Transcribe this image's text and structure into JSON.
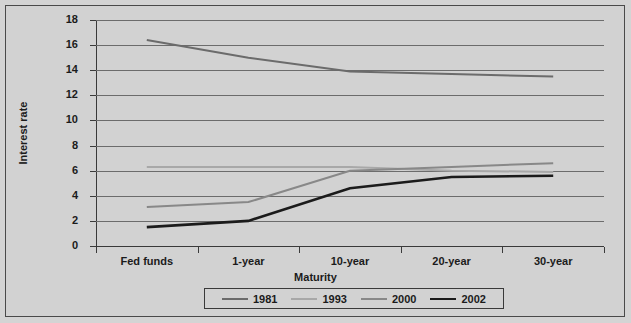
{
  "chart_data": {
    "type": "line",
    "title": "",
    "xlabel": "Maturity",
    "ylabel": "Interest rate",
    "categories": [
      "Fed funds",
      "1-year",
      "10-year",
      "20-year",
      "30-year"
    ],
    "ylim": [
      0,
      18
    ],
    "ytick_step": 2,
    "yticks": [
      "0",
      "2",
      "4",
      "6",
      "8",
      "10",
      "12",
      "14",
      "16",
      "18"
    ],
    "grid": true,
    "legend_position": "bottom",
    "series": [
      {
        "name": "1981",
        "color": "#6b6b6b",
        "width": 2.0,
        "values": [
          16.4,
          15.0,
          13.9,
          13.7,
          13.5
        ]
      },
      {
        "name": "1993",
        "color": "#a8a8a8",
        "width": 2.0,
        "values": [
          6.3,
          6.3,
          6.3,
          6.0,
          5.9
        ]
      },
      {
        "name": "2000",
        "color": "#888888",
        "width": 2.0,
        "values": [
          3.1,
          3.5,
          6.0,
          6.3,
          6.6
        ]
      },
      {
        "name": "2002",
        "color": "#1b1b1b",
        "width": 2.6,
        "values": [
          1.5,
          2.0,
          4.6,
          5.5,
          5.6
        ]
      }
    ]
  },
  "legend": {
    "entries": [
      {
        "label": "1981"
      },
      {
        "label": "1993"
      },
      {
        "label": "2000"
      },
      {
        "label": "2002"
      }
    ]
  },
  "colors": {
    "background": "#d2d2d2",
    "frame": "#4a4a4a",
    "gridline": "#6c6c6c",
    "axis": "#3a3a3a",
    "text": "#1b1b1b"
  }
}
